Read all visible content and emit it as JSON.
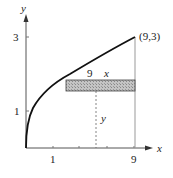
{
  "diagram": {
    "axes": {
      "x_label": "x",
      "y_label": "y",
      "x_ticks": [
        {
          "value": 1,
          "label": "1"
        },
        {
          "value": 9,
          "label": "9"
        }
      ],
      "y_ticks": [
        {
          "value": 1,
          "label": "1"
        },
        {
          "value": 3,
          "label": "3"
        }
      ]
    },
    "curve": "x = y^2",
    "point_label": "(9,3)",
    "strip": {
      "right_label": "9",
      "left_label": "x",
      "height_label": "y"
    },
    "colors": {
      "curve": "#111111",
      "axis": "#444444",
      "strip_fill": "#b8b8b8",
      "strip_stroke": "#333333"
    }
  }
}
